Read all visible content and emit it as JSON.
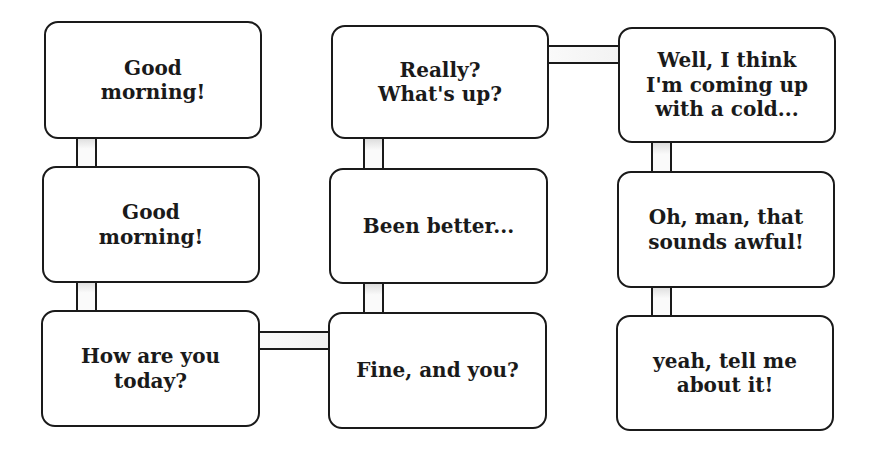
{
  "diagram": {
    "columns": [
      {
        "boxes": [
          {
            "text": "Good\nmorning!"
          },
          {
            "text": "Good\nmorning!"
          },
          {
            "text": "How are you\ntoday?"
          }
        ]
      },
      {
        "boxes": [
          {
            "text": "Really?\nWhat's up?"
          },
          {
            "text": "Been better..."
          },
          {
            "text": "Fine, and you?"
          }
        ]
      },
      {
        "boxes": [
          {
            "text": "Well, I think\nI'm coming up\nwith a cold..."
          },
          {
            "text": "Oh, man, that\nsounds awful!"
          },
          {
            "text": "yeah, tell me\nabout it!"
          }
        ]
      }
    ],
    "sequence": [
      "Good morning!",
      "Good morning!",
      "How are you today?",
      "Fine, and you?",
      "Been better...",
      "Really? What's up?",
      "Well, I think I'm coming up with a cold...",
      "Oh, man, that sounds awful!",
      "yeah, tell me about it!"
    ],
    "colors": {
      "stroke": "#1a1a1a",
      "fill": "#ffffff"
    }
  }
}
